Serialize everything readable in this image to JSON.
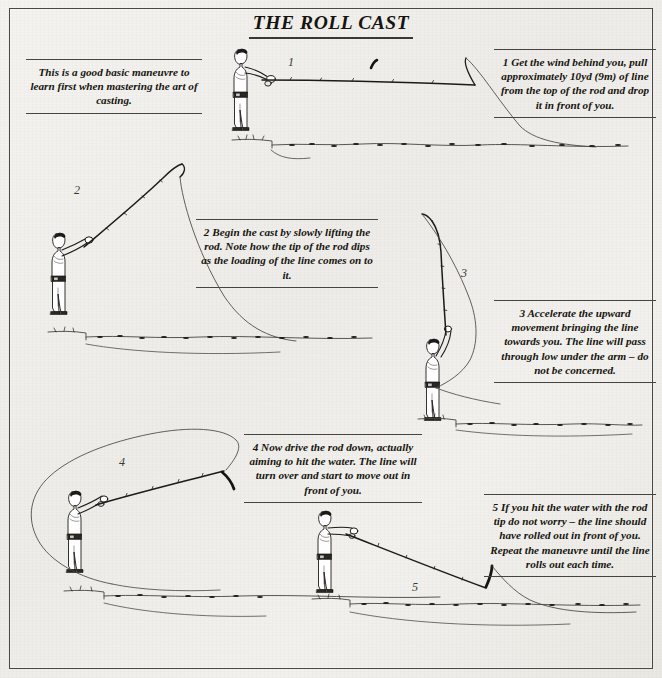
{
  "page": {
    "title": "THE ROLL CAST",
    "background_color": "#efeeea",
    "ink_color": "#17150f",
    "frame_color": "#4a4844"
  },
  "intro": {
    "text": "This is a good basic maneuvre to learn first when mastering the art of casting."
  },
  "steps": [
    {
      "number": "1",
      "text": "1 Get the wind behind you, pull approximately 10yd (9m) of line from the top of the rod and drop it in front of you."
    },
    {
      "number": "2",
      "text": "2 Begin the cast by slowly lifting the rod. Note how the tip of the rod dips as the loading of the line comes on to it."
    },
    {
      "number": "3",
      "text": "3 Accelerate the upward movement bringing the line towards you. The line will pass through low under the arm – do not be concerned."
    },
    {
      "number": "4",
      "text": "4 Now drive the rod down, actually aiming to hit the water. The line will turn over and start to move out in front of you."
    },
    {
      "number": "5",
      "text": "5 If you hit the water with the rod tip do not worry – the line should have rolled out in front of you. Repeat the maneuvre until the line rolls out each time."
    }
  ],
  "figures": [
    {
      "label": "1",
      "alt": "angler-holding-rod-horizontal-line-on-water"
    },
    {
      "label": "2",
      "alt": "angler-lifting-rod-line-looping-back"
    },
    {
      "label": "3",
      "alt": "angler-rod-vertical-line-passing-under-arm"
    },
    {
      "label": "4",
      "alt": "angler-driving-rod-down-large-line-loop"
    },
    {
      "label": "5",
      "alt": "angler-rod-tip-at-water-line-rolled-out"
    }
  ]
}
